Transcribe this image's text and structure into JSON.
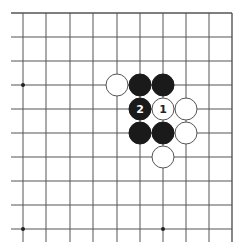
{
  "diagram": {
    "type": "go-board-fragment",
    "grid": {
      "columns_x": [
        23,
        46,
        70,
        93,
        117,
        140,
        163,
        186,
        209,
        232
      ],
      "rows_y": [
        13,
        37,
        61,
        85,
        109,
        133,
        157,
        181,
        205,
        229
      ],
      "line_color": "#555555",
      "top_edge": true,
      "right_edge": true,
      "left_open_extent_x": 11,
      "bottom_open_extent_y": 242
    },
    "star_points": [
      {
        "col": 0,
        "row": 3
      },
      {
        "col": 6,
        "row": 3
      },
      {
        "col": 0,
        "row": 9
      },
      {
        "col": 6,
        "row": 9
      }
    ],
    "stones": [
      {
        "color": "white",
        "col": 4,
        "row": 3,
        "label": ""
      },
      {
        "color": "black",
        "col": 5,
        "row": 3,
        "label": ""
      },
      {
        "color": "black",
        "col": 6,
        "row": 3,
        "label": ""
      },
      {
        "color": "black",
        "col": 5,
        "row": 4,
        "label": "2"
      },
      {
        "color": "white",
        "col": 6,
        "row": 4,
        "label": "1"
      },
      {
        "color": "white",
        "col": 7,
        "row": 4,
        "label": ""
      },
      {
        "color": "black",
        "col": 5,
        "row": 5,
        "label": ""
      },
      {
        "color": "black",
        "col": 6,
        "row": 5,
        "label": ""
      },
      {
        "color": "white",
        "col": 7,
        "row": 5,
        "label": ""
      },
      {
        "color": "white",
        "col": 6,
        "row": 6,
        "label": ""
      }
    ],
    "colors": {
      "black_stone": "#1a1a1a",
      "white_stone": "#ffffff",
      "white_stone_outline": "#555555",
      "black_label": "#ffffff",
      "white_label": "#222222"
    },
    "stone_radius": 11
  }
}
